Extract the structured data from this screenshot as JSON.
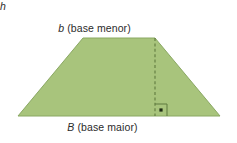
{
  "figure": {
    "name": "trapezoid-diagram",
    "shape": "trapezoid",
    "background_color": "#ffffff",
    "fill_color": "#a8c47c",
    "stroke_color": "#8aa863",
    "text_color": "#2b2b2b",
    "dash_color": "#5f7a3f",
    "labels": {
      "top_var": "b",
      "top_text": " (base menor)",
      "top_full": "b (base menor)",
      "bottom_var": "B",
      "bottom_text": " (base maior)",
      "bottom_full": "B (base maior)",
      "height_var": "h"
    },
    "geometry": {
      "top_left": [
        83,
        38
      ],
      "top_right": [
        155,
        38
      ],
      "bottom_right": [
        220,
        116
      ],
      "bottom_left": [
        18,
        116
      ],
      "height_line_x": 155,
      "height_line_y_top": 38,
      "height_line_y_bottom": 116,
      "right_angle_marker_size": 12
    }
  }
}
